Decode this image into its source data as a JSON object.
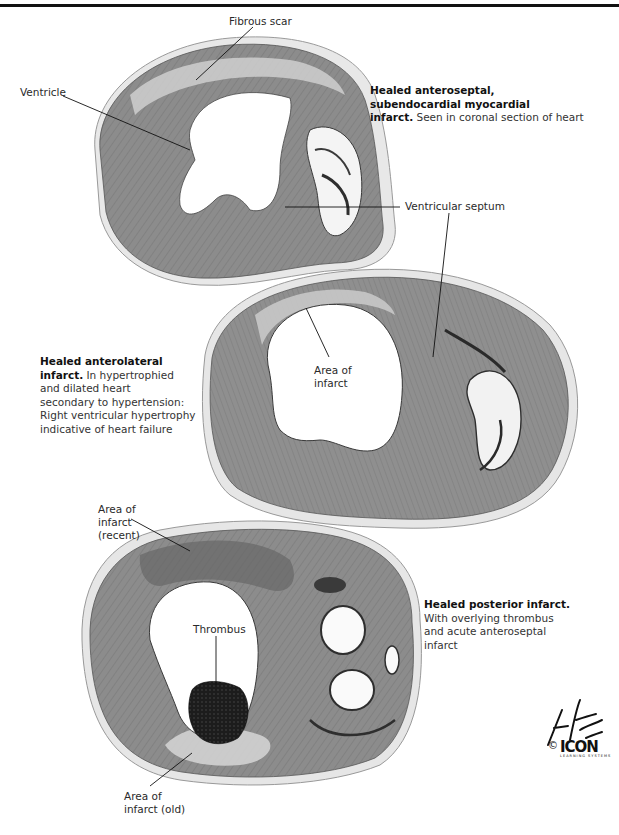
{
  "figure": {
    "top_rule_color": "#111111",
    "tissue_color": "#8a8a8a",
    "tissue_dark": "#5e5e5e",
    "scar_color": "#c9c9c9",
    "thrombus_color": "#1e1e1e"
  },
  "panels": [
    {
      "id": "top",
      "labels": {
        "fibrous_scar": "Fibrous scar",
        "ventricle": "Ventricle",
        "ventricular_septum": "Ventricular septum"
      },
      "caption": {
        "bold": "Healed anteroseptal, subendocardial myocardial infarct.",
        "bold_line1": "Healed anteroseptal,",
        "bold_line2": "subendocardial myocardial",
        "bold_line3": "infarct.",
        "rest": " Seen in coronal section of heart"
      }
    },
    {
      "id": "middle",
      "labels": {
        "area_of_infarct_line1": "Area of",
        "area_of_infarct_line2": "infarct"
      },
      "caption": {
        "bold_line1": "Healed anterolateral",
        "bold_line2": "infarct.",
        "rest_line2": " In hypertrophied",
        "line3": "and dilated heart",
        "line4": "secondary to hypertension:",
        "line5": "Right ventricular hypertrophy",
        "line6": "indicative of heart failure"
      }
    },
    {
      "id": "bottom",
      "labels": {
        "recent_line1": "Area of",
        "recent_line2": "infarct",
        "recent_line3": "(recent)",
        "thrombus": "Thrombus",
        "old_line1": "Area of",
        "old_line2": "infarct (old)"
      },
      "caption": {
        "bold_line1": "Healed posterior infarct.",
        "line2": "With overlying thrombus",
        "line3": "and acute anteroseptal",
        "line4": "infarct"
      }
    }
  ],
  "signature": {
    "artist": "F. Netter M.D.",
    "copyright_symbol": "©",
    "publisher_logo": "ICON",
    "publisher_sub": "LEARNING SYSTEMS"
  }
}
